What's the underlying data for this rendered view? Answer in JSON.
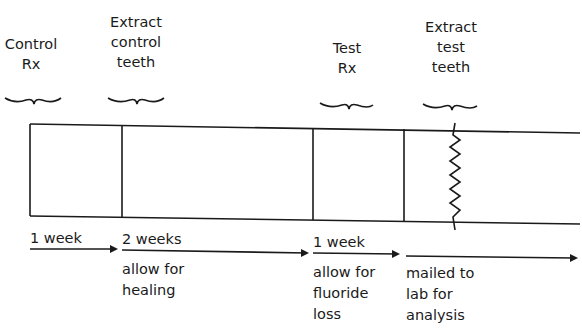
{
  "diagram": {
    "events": [
      {
        "label": "Control\nRx"
      },
      {
        "label": "Extract\ncontrol\nteeth"
      },
      {
        "label": "Test\nRx"
      },
      {
        "label": "Extract\ntest\nteeth"
      }
    ],
    "intervals": [
      {
        "duration": "1 week",
        "note": ""
      },
      {
        "duration": "2 weeks",
        "note": "allow for\nhealing"
      },
      {
        "duration": "1 week",
        "note": "allow for\nfluoride\nloss"
      },
      {
        "duration": "",
        "note": "mailed to\nlab for\nanalysis"
      }
    ]
  }
}
